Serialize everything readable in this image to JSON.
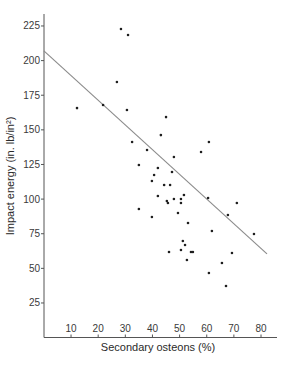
{
  "chart_data": {
    "type": "scatter",
    "title": "",
    "xlabel": "Secondary osteons (%)",
    "ylabel": "Impact energy (in. lb/in²)",
    "xlim": [
      0,
      85
    ],
    "ylim": [
      0,
      235
    ],
    "xticks": [
      10,
      20,
      30,
      40,
      50,
      60,
      70,
      80
    ],
    "yticks": [
      25,
      50,
      75,
      100,
      125,
      150,
      175,
      200,
      225
    ],
    "grid": false,
    "legend": null,
    "series": [
      {
        "name": "observations",
        "points": [
          [
            28.4,
            222.8
          ],
          [
            31.0,
            218.5
          ],
          [
            26.9,
            184.5
          ],
          [
            12.2,
            165.7
          ],
          [
            21.8,
            167.9
          ],
          [
            30.6,
            164.3
          ],
          [
            45.0,
            159.2
          ],
          [
            43.1,
            146.2
          ],
          [
            32.5,
            141.2
          ],
          [
            38.0,
            135.4
          ],
          [
            47.9,
            130.4
          ],
          [
            35.0,
            124.6
          ],
          [
            42.0,
            122.5
          ],
          [
            47.2,
            119.6
          ],
          [
            40.6,
            117.4
          ],
          [
            39.8,
            113.1
          ],
          [
            44.3,
            110.2
          ],
          [
            46.5,
            110.2
          ],
          [
            42.0,
            102.2
          ],
          [
            45.3,
            98.6
          ],
          [
            45.7,
            97.2
          ],
          [
            47.9,
            100.1
          ],
          [
            50.5,
            100.1
          ],
          [
            51.6,
            103.0
          ],
          [
            50.5,
            97.2
          ],
          [
            35.0,
            92.9
          ],
          [
            49.4,
            90.0
          ],
          [
            39.8,
            87.1
          ],
          [
            53.1,
            82.7
          ],
          [
            61.9,
            77.0
          ],
          [
            51.2,
            69.7
          ],
          [
            52.0,
            66.9
          ],
          [
            46.1,
            61.8
          ],
          [
            50.5,
            63.2
          ],
          [
            54.2,
            61.8
          ],
          [
            54.9,
            61.8
          ],
          [
            52.7,
            56.0
          ],
          [
            60.8,
            46.6
          ],
          [
            60.8,
            141.2
          ],
          [
            57.9,
            134.0
          ],
          [
            60.5,
            100.8
          ],
          [
            71.1,
            97.2
          ],
          [
            67.8,
            88.5
          ],
          [
            77.4,
            74.8
          ],
          [
            69.3,
            61.1
          ],
          [
            65.6,
            53.9
          ],
          [
            67.1,
            37.3
          ]
        ]
      }
    ],
    "regression_line": {
      "from": [
        0,
        207
      ],
      "to": [
        82.2,
        60.4
      ]
    }
  },
  "colors": {
    "axis": "#555555",
    "points": "#1e1e1e",
    "line": "#8a8a8a"
  }
}
